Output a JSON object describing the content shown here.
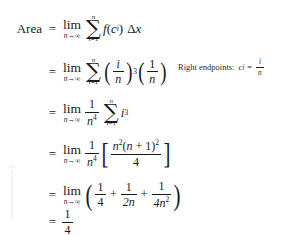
{
  "document": {
    "type": "math-derivation",
    "subject": "Area under a curve via Riemann sum limit",
    "result": "1/4"
  },
  "lines": [
    {
      "id": "line1",
      "label": "Area",
      "equals": "=",
      "limit_main": "lim",
      "limit_sub_var": "n",
      "limit_sub_arrow": "→",
      "limit_sub_target": "∞",
      "sum_top": "n",
      "sum_glyph": "∑",
      "sum_bottom_var": "i",
      "sum_bottom_eq": "=",
      "sum_bottom_val": "1",
      "body_text": "f(c_i) Δx",
      "func": "f",
      "func_arg_var": "c",
      "func_arg_sub": "i",
      "delta": "Δ",
      "delta_var": "x"
    },
    {
      "id": "line2",
      "label": "",
      "equals": "=",
      "limit_main": "lim",
      "limit_sub_var": "n",
      "limit_sub_arrow": "→",
      "limit_sub_target": "∞",
      "sum_top": "n",
      "sum_glyph": "∑",
      "sum_bottom_var": "i",
      "sum_bottom_eq": "=",
      "sum_bottom_val": "1",
      "frac1_num": "i",
      "frac1_den": "n",
      "frac1_exp": "3",
      "frac2_num": "1",
      "frac2_den": "n"
    },
    {
      "id": "line3",
      "label": "",
      "equals": "=",
      "limit_main": "lim",
      "limit_sub_var": "n",
      "limit_sub_arrow": "→",
      "limit_sub_target": "∞",
      "coef_num": "1",
      "coef_den": "n",
      "coef_den_exp": "4",
      "sum_top": "n",
      "sum_glyph": "∑",
      "sum_bottom_var": "i",
      "sum_bottom_eq": "=",
      "sum_bottom_val": "1",
      "summand_var": "i",
      "summand_exp": "3"
    },
    {
      "id": "line4",
      "label": "",
      "equals": "=",
      "limit_main": "lim",
      "limit_sub_var": "n",
      "limit_sub_arrow": "→",
      "limit_sub_target": "∞",
      "coef_num": "1",
      "coef_den": "n",
      "coef_den_exp": "4",
      "bracket_open": "[",
      "bracket_close": "]",
      "inner_num_n": "n",
      "inner_num_n_exp": "2",
      "inner_num_paren_open": "(",
      "inner_num_var": "n",
      "inner_num_plus": "+",
      "inner_num_one": "1",
      "inner_num_paren_close": ")",
      "inner_num_close_exp": "2",
      "inner_den": "4"
    },
    {
      "id": "line5",
      "label": "",
      "equals": "=",
      "limit_main": "lim",
      "limit_sub_var": "n",
      "limit_sub_arrow": "→",
      "limit_sub_target": "∞",
      "paren_open": "(",
      "paren_close": ")",
      "t1_num": "1",
      "t1_den": "4",
      "op1": "+",
      "t2_num": "1",
      "t2_den": "2n",
      "op2": "+",
      "t3_num": "1",
      "t3_den": "4n",
      "t3_den_exp": "2"
    },
    {
      "id": "line6",
      "label": "",
      "equals": "=",
      "result_num": "1",
      "result_den": "4"
    }
  ],
  "annotation": {
    "label": "Right endpoints:",
    "variable": "c",
    "subscript": "i",
    "equals": "=",
    "frac_num": "i",
    "frac_den": "n"
  }
}
